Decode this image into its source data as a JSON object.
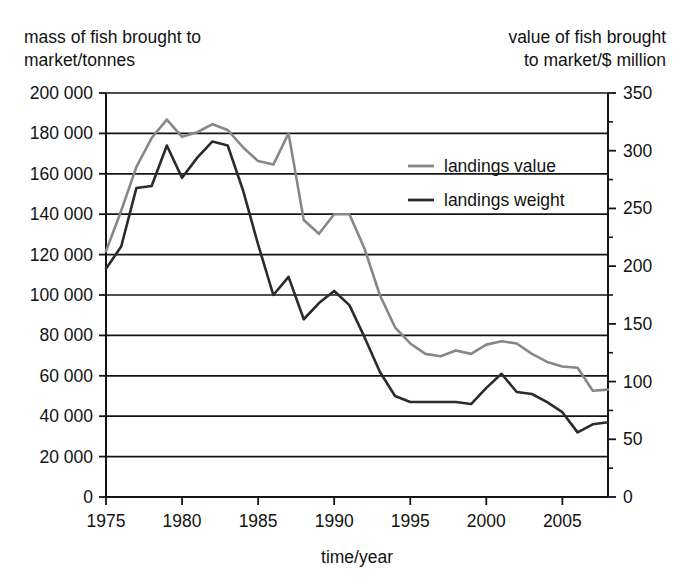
{
  "headers": {
    "left": "mass of fish brought to\nmarket/tonnes",
    "right": "value of fish brought\nto market/$ million"
  },
  "chart_data": {
    "type": "line",
    "title": "",
    "subtitle": "",
    "xlabel": "time/year",
    "ylabel": "mass of fish brought to market/tonnes",
    "y2label": "value of fish brought to market/$ million",
    "grid": true,
    "legend_position": "inside-upper-right",
    "xlim": [
      1975,
      2008
    ],
    "ylim": [
      0,
      200000
    ],
    "y2lim": [
      0,
      350
    ],
    "xticks": [
      1975,
      1980,
      1985,
      1990,
      1995,
      2000,
      2005
    ],
    "xticklabels": [
      "1975",
      "1980",
      "1985",
      "1990",
      "1995",
      "2000",
      "2005"
    ],
    "yticks": [
      0,
      20000,
      40000,
      60000,
      80000,
      100000,
      120000,
      140000,
      160000,
      180000,
      200000
    ],
    "yticklabels": [
      "0",
      "20 000",
      "40 000",
      "60 000",
      "80 000",
      "100 000",
      "120 000",
      "140 000",
      "160 000",
      "180 000",
      "200 000"
    ],
    "y2ticks": [
      0,
      50,
      100,
      150,
      200,
      250,
      300,
      350
    ],
    "y2ticklabels": [
      "0",
      "50",
      "100",
      "150",
      "200",
      "250",
      "300",
      "350"
    ],
    "y2minorticks": [
      25,
      75,
      125,
      175,
      225,
      275,
      325
    ],
    "x": [
      1975,
      1976,
      1977,
      1978,
      1979,
      1980,
      1981,
      1982,
      1983,
      1984,
      1985,
      1986,
      1987,
      1988,
      1989,
      1990,
      1991,
      1992,
      1993,
      1994,
      1995,
      1996,
      1997,
      1998,
      1999,
      2000,
      2001,
      2002,
      2003,
      2004,
      2005,
      2006,
      2007,
      2008
    ],
    "series": [
      {
        "name": "landings value",
        "axis": "right",
        "color": "#878787",
        "units": "$ million",
        "values": [
          213,
          248,
          286,
          311,
          327,
          312,
          316,
          323,
          318,
          303,
          291,
          288,
          315,
          240,
          228,
          245,
          245,
          215,
          175,
          147,
          133,
          124,
          122,
          127,
          124,
          132,
          135,
          133,
          124,
          117,
          113,
          112,
          92,
          93
        ]
      },
      {
        "name": "landings weight",
        "axis": "left",
        "color": "#2b2b2b",
        "units": "tonnes",
        "values": [
          113000,
          124000,
          153000,
          154000,
          174000,
          158000,
          168000,
          176000,
          174000,
          152000,
          125000,
          100000,
          109000,
          88000,
          96000,
          102000,
          95000,
          79000,
          62000,
          50000,
          47000,
          47000,
          47000,
          47000,
          46000,
          54000,
          61000,
          52000,
          51000,
          47000,
          42000,
          32000,
          36000,
          37000
        ]
      }
    ]
  }
}
